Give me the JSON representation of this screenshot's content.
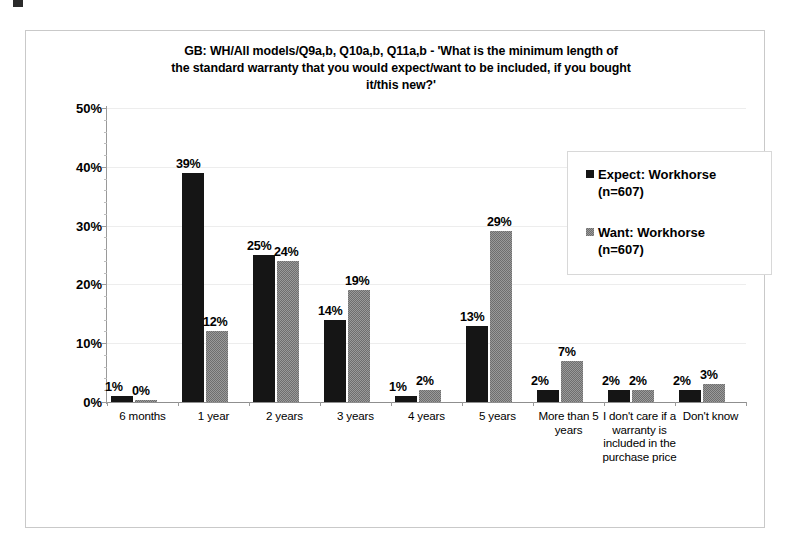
{
  "chart_data": {
    "type": "bar",
    "title": "GB: WH/All models/Q9a,b, Q10a,b, Q11a,b - 'What is the minimum length of the standard warranty that you would expect/want to be included, if you bought it/this new?'",
    "title_lines": [
      "GB: WH/All models/Q9a,b, Q10a,b, Q11a,b - 'What is the minimum length of",
      "the standard warranty that you would expect/want to be included, if you bought",
      "it/this new?'"
    ],
    "xlabel": "",
    "ylabel": "",
    "ylim": [
      0,
      50
    ],
    "ytick_labels": [
      "0%",
      "10%",
      "20%",
      "30%",
      "40%",
      "50%"
    ],
    "ytick_values": [
      0,
      10,
      20,
      30,
      40,
      50
    ],
    "grid": true,
    "legend_position": "top-right",
    "categories": [
      "6 months",
      "1 year",
      "2 years",
      "3 years",
      "4 years",
      "5 years",
      "More than 5 years",
      "I don't care if a warranty is included in the purchase price",
      "Don't know"
    ],
    "series": [
      {
        "name": "Expect: Workhorse (n=607)",
        "color": "#151515",
        "values": [
          1,
          39,
          25,
          14,
          1,
          13,
          2,
          2,
          2
        ],
        "labels": [
          "1%",
          "39%",
          "25%",
          "14%",
          "1%",
          "13%",
          "2%",
          "2%",
          "2%"
        ]
      },
      {
        "name": "Want: Workhorse (n=607)",
        "color": "#868686",
        "values": [
          0,
          12,
          24,
          19,
          2,
          29,
          7,
          2,
          3
        ],
        "labels": [
          "0%",
          "12%",
          "24%",
          "19%",
          "2%",
          "29%",
          "7%",
          "2%",
          "3%"
        ]
      }
    ]
  },
  "legend": {
    "entries": [
      {
        "line1": "Expect: Workhorse",
        "line2": "(n=607)",
        "swatch": "black-square-icon"
      },
      {
        "line1": "Want: Workhorse",
        "line2": "(n=607)",
        "swatch": "gray-square-icon"
      }
    ]
  }
}
